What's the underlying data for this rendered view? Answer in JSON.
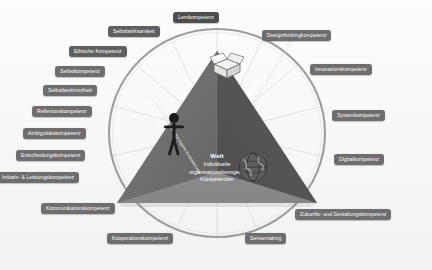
{
  "diagram": {
    "center": {
      "world_title": "Welt",
      "world_line1": "Individuelle",
      "world_line2": "organisationsbezogene",
      "world_line3": "Kompetenzen",
      "left_axis_label": "Subjekt",
      "left_axis_sub": "Individuelle personenbezogene Kompetenzen",
      "right_axis_label": "Objekt",
      "right_axis_sub": "Individuelle aufgabenbezogene Kompetenzen"
    },
    "icons": {
      "person": "person-icon",
      "globe": "globe-icon",
      "box": "open-box-icon"
    },
    "colors": {
      "pyramid_left": "#6d6d6d",
      "pyramid_right": "#5a5a5a",
      "pyramid_base": "#8e8e8e",
      "ring": "#9a9a9a",
      "chip": "#7a7a7a",
      "page": "#fbfbfa"
    },
    "competences": [
      {
        "label": "Lernkompetenz",
        "side": "top",
        "tone": "darker"
      },
      {
        "label": "Selbstwirksamkeit",
        "side": "left",
        "tone": "dark"
      },
      {
        "label": "Ethische Kompetenz",
        "side": "left",
        "tone": "dark"
      },
      {
        "label": "Selbstkompetenz",
        "side": "left",
        "tone": "mid"
      },
      {
        "label": "Selbstbestimmtheit",
        "side": "left",
        "tone": "mid"
      },
      {
        "label": "Reflexionskompetenz",
        "side": "left",
        "tone": "mid"
      },
      {
        "label": "Ambiguitätskompetenz",
        "side": "left",
        "tone": "mid"
      },
      {
        "label": "Entscheidungskompetenz",
        "side": "left",
        "tone": "mid"
      },
      {
        "label": "Initiativ- & Leistungskompetenz",
        "side": "left",
        "tone": "mid"
      },
      {
        "label": "Kommunikationskompetenz",
        "side": "bottom",
        "tone": "mid"
      },
      {
        "label": "Kooperationskompetenz",
        "side": "bottom",
        "tone": "mid"
      },
      {
        "label": "Sensemaking",
        "side": "bottom",
        "tone": "mid"
      },
      {
        "label": "Zukunfts- und Gestaltungskompetenz",
        "side": "right",
        "tone": "mid"
      },
      {
        "label": "Digitalkompetenz",
        "side": "right",
        "tone": "mid"
      },
      {
        "label": "Systemkompetenz",
        "side": "right",
        "tone": "mid"
      },
      {
        "label": "Innovationskompetenz",
        "side": "right",
        "tone": "mid"
      },
      {
        "label": "Designthinkingkompetenz",
        "side": "right",
        "tone": "mid"
      }
    ]
  }
}
